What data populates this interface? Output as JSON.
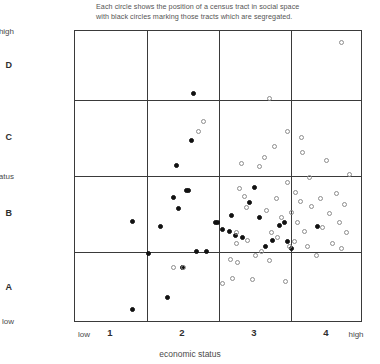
{
  "caption": {
    "line1": "Each circle shows the position of a census tract in social space",
    "line2": "with black circles marking those tracts which are segregated."
  },
  "axes": {
    "y_top_label": "high",
    "y_bottom_label": "low",
    "y_axis_title": "family status",
    "y_bands": [
      "D",
      "C",
      "B",
      "A"
    ],
    "x_low_label": "low",
    "x_high_label": "high",
    "x_ticks": [
      "1",
      "2",
      "3",
      "4"
    ],
    "x_axis_title": "economic status"
  },
  "legend": {
    "filled_meaning": "segregated tract",
    "open_meaning": "non-segregated tract"
  },
  "colors": {
    "filled": "#111111",
    "open_stroke": "#8d8d8d",
    "frame": "#3a3a3a",
    "text": "#4a4a4a",
    "background": "#ffffff"
  },
  "chart_data": {
    "type": "scatter",
    "title": "Each circle shows the position of a census tract in social space with black circles marking those tracts which are segregated.",
    "xlabel": "economic status",
    "ylabel": "family status",
    "xlim": [
      0,
      4.6
    ],
    "ylim": [
      0,
      4.6
    ],
    "xticks": [
      1,
      2,
      3,
      4
    ],
    "xticklabels": [
      "1",
      "2",
      "3",
      "4"
    ],
    "ybandlabels": [
      "A",
      "B",
      "C",
      "D"
    ],
    "grid": true,
    "gridlines_x": [
      1.5,
      2.5,
      3.5
    ],
    "gridlines_y": [
      1.5,
      2.5,
      3.5
    ],
    "legend_position": "none",
    "series": [
      {
        "name": "segregated",
        "marker": "filled-circle",
        "color": "#111111",
        "points": [
          [
            0.92,
            0.22
          ],
          [
            0.92,
            1.6
          ],
          [
            1.18,
            1.1
          ],
          [
            1.36,
            1.52
          ],
          [
            1.48,
            0.4
          ],
          [
            1.58,
            1.98
          ],
          [
            1.62,
            2.48
          ],
          [
            1.66,
            1.8
          ],
          [
            1.72,
            0.88
          ],
          [
            1.78,
            2.08
          ],
          [
            1.82,
            2.08
          ],
          [
            1.86,
            2.88
          ],
          [
            1.9,
            3.62
          ],
          [
            1.94,
            1.12
          ],
          [
            2.1,
            1.12
          ],
          [
            2.24,
            1.58
          ],
          [
            2.28,
            1.58
          ],
          [
            2.36,
            1.48
          ],
          [
            2.46,
            1.44
          ],
          [
            2.5,
            1.7
          ],
          [
            2.56,
            1.38
          ],
          [
            2.68,
            1.34
          ],
          [
            2.78,
            1.9
          ],
          [
            2.86,
            2.14
          ],
          [
            2.94,
            1.66
          ],
          [
            3.04,
            1.2
          ],
          [
            3.16,
            1.3
          ],
          [
            3.26,
            1.54
          ],
          [
            3.34,
            1.58
          ],
          [
            3.4,
            1.28
          ],
          [
            3.46,
            1.18
          ],
          [
            3.88,
            1.52
          ]
        ]
      },
      {
        "name": "not segregated",
        "marker": "open-circle",
        "color": "#8d8d8d",
        "points": [
          [
            1.58,
            0.88
          ],
          [
            1.74,
            0.88
          ],
          [
            1.98,
            3.02
          ],
          [
            2.06,
            3.18
          ],
          [
            2.36,
            0.62
          ],
          [
            2.48,
            1.0
          ],
          [
            2.52,
            0.7
          ],
          [
            2.58,
            1.26
          ],
          [
            2.58,
            1.42
          ],
          [
            2.6,
            0.96
          ],
          [
            2.62,
            2.12
          ],
          [
            2.66,
            2.52
          ],
          [
            2.7,
            2.0
          ],
          [
            2.74,
            1.82
          ],
          [
            2.76,
            1.3
          ],
          [
            2.84,
            0.68
          ],
          [
            2.88,
            1.06
          ],
          [
            2.94,
            2.46
          ],
          [
            2.98,
            1.12
          ],
          [
            3.02,
            2.6
          ],
          [
            3.06,
            1.78
          ],
          [
            3.1,
            0.98
          ],
          [
            3.14,
            1.42
          ],
          [
            3.18,
            2.78
          ],
          [
            3.22,
            1.96
          ],
          [
            3.24,
            1.34
          ],
          [
            3.3,
            1.66
          ],
          [
            3.36,
            0.66
          ],
          [
            3.4,
            2.22
          ],
          [
            3.42,
            1.2
          ],
          [
            3.46,
            1.74
          ],
          [
            3.5,
            1.28
          ],
          [
            3.52,
            2.06
          ],
          [
            3.56,
            1.58
          ],
          [
            3.6,
            1.92
          ],
          [
            3.64,
            2.68
          ],
          [
            3.66,
            1.44
          ],
          [
            3.72,
            1.2
          ],
          [
            3.74,
            2.3
          ],
          [
            3.78,
            1.84
          ],
          [
            3.86,
            1.06
          ],
          [
            3.92,
            1.96
          ],
          [
            3.96,
            1.5
          ],
          [
            4.02,
            2.56
          ],
          [
            4.06,
            1.72
          ],
          [
            4.12,
            1.26
          ],
          [
            4.18,
            2.04
          ],
          [
            4.22,
            1.58
          ],
          [
            4.26,
            1.18
          ],
          [
            4.3,
            1.86
          ],
          [
            4.34,
            1.42
          ],
          [
            4.38,
            2.34
          ],
          [
            4.26,
            4.42
          ],
          [
            3.1,
            3.54
          ],
          [
            3.4,
            3.02
          ],
          [
            3.62,
            2.92
          ]
        ]
      }
    ]
  }
}
